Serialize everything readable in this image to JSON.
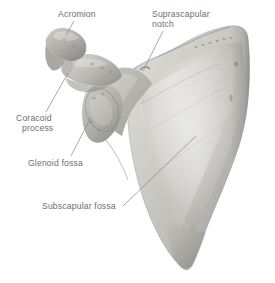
{
  "figure": {
    "subject": "scapula",
    "view": "anterior (costal) surface, right scapula",
    "background_color": "#ffffff",
    "label_color": "#6e6e73",
    "leader_color": "#8c8c91",
    "bone_light": "#e3e2de",
    "bone_mid": "#c3c2bd",
    "bone_shadow": "#8f8e8a"
  },
  "labels": [
    {
      "id": "acromion",
      "line1": "Acromion",
      "line2": "",
      "icon": "leader-line-icon"
    },
    {
      "id": "suprascapular-notch",
      "line1": "Suprascapular",
      "line2": "notch",
      "icon": "leader-line-icon"
    },
    {
      "id": "coracoid-process",
      "line1": "Coracoid",
      "line2": "process",
      "icon": "leader-line-icon"
    },
    {
      "id": "glenoid-fossa",
      "line1": "Glenoid fossa",
      "line2": "",
      "icon": "leader-line-icon"
    },
    {
      "id": "subscapular-fossa",
      "line1": "Subscapular fossa",
      "line2": "",
      "icon": "leader-line-icon"
    }
  ]
}
